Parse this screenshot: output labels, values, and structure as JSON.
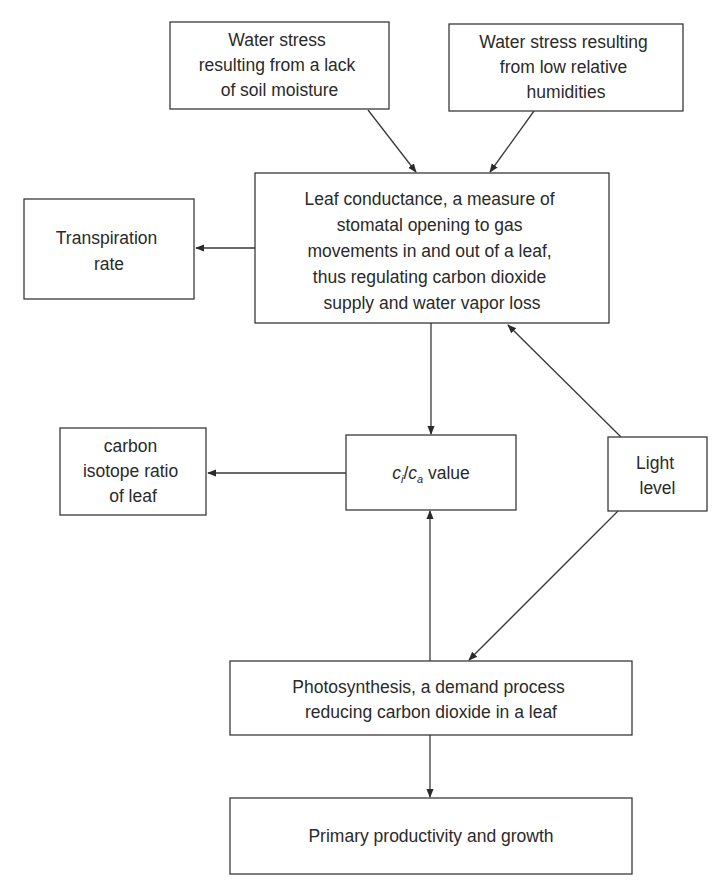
{
  "diagram": {
    "nodes": {
      "soil_moisture": {
        "lines": [
          "Water stress",
          "resulting from a lack",
          "of soil moisture"
        ]
      },
      "humidity": {
        "lines": [
          "Water stress resulting",
          "from low relative",
          "humidities"
        ]
      },
      "leaf_conductance": {
        "lines": [
          "Leaf conductance, a measure of",
          "stomatal opening to gas",
          "movements in and out of a leaf,",
          "thus regulating carbon dioxide",
          "supply and water vapor loss"
        ]
      },
      "transpiration": {
        "lines": [
          "Transpiration",
          "rate"
        ]
      },
      "carbon_isotope": {
        "lines": [
          "carbon",
          "isotope ratio",
          "of leaf"
        ]
      },
      "ci_ca": {
        "c1": "c",
        "s1": "i",
        "slash": "/",
        "c2": "c",
        "s2": "a",
        "suffix": " value"
      },
      "light": {
        "lines": [
          "Light",
          "level"
        ]
      },
      "photosynthesis": {
        "lines": [
          "Photosynthesis, a demand process",
          "reducing carbon dioxide in a leaf"
        ]
      },
      "productivity": {
        "lines": [
          "Primary productivity and growth"
        ]
      }
    },
    "edges": [
      {
        "from": "soil_moisture",
        "to": "leaf_conductance"
      },
      {
        "from": "humidity",
        "to": "leaf_conductance"
      },
      {
        "from": "leaf_conductance",
        "to": "transpiration"
      },
      {
        "from": "leaf_conductance",
        "to": "ci_ca"
      },
      {
        "from": "ci_ca",
        "to": "carbon_isotope"
      },
      {
        "from": "light",
        "to": "leaf_conductance"
      },
      {
        "from": "light",
        "to": "photosynthesis"
      },
      {
        "from": "photosynthesis",
        "to": "ci_ca"
      },
      {
        "from": "photosynthesis",
        "to": "productivity"
      }
    ]
  }
}
